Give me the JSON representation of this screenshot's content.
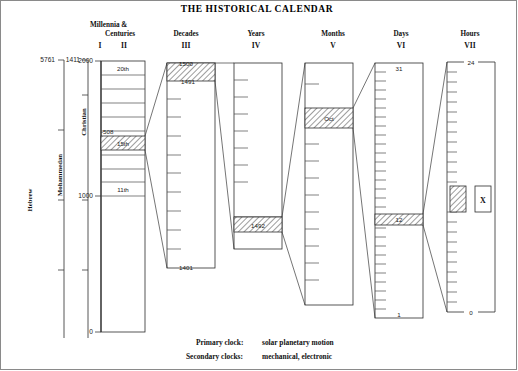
{
  "title": "THE HISTORICAL CALENDAR",
  "captions": {
    "primary_label": "Primary clock:",
    "primary_value": "solar planetary motion",
    "secondary_label": "Secondary clocks:",
    "secondary_value": "mechanical, electronic"
  },
  "era_axes": [
    {
      "name": "Hebrew",
      "top_value": "5761"
    },
    {
      "name": "Mohammedan",
      "top_value": "1411"
    }
  ],
  "columns": [
    {
      "id": "I",
      "roman": "I",
      "header": "Millennia &",
      "header2": "Centuries",
      "scale_name": "Christian",
      "top_label": "2000",
      "mid_label": "1000",
      "bottom_label": "0"
    },
    {
      "id": "II",
      "roman": "II",
      "header": "",
      "top_label": "20th",
      "highlight_label": "15th",
      "edge_label": "-508",
      "low_label": "11th"
    },
    {
      "id": "III",
      "roman": "III",
      "header": "Decades",
      "top_label": "1500",
      "second_label": "1491",
      "bottom_label": "1401"
    },
    {
      "id": "IV",
      "roman": "IV",
      "header": "Years",
      "highlight_label": "1492"
    },
    {
      "id": "V",
      "roman": "V",
      "header": "Months",
      "highlight_label": "Oct"
    },
    {
      "id": "VI",
      "roman": "VI",
      "header": "Days",
      "top_label": "31",
      "highlight_label": "12",
      "bottom_label": "1"
    },
    {
      "id": "VII",
      "roman": "VII",
      "header": "Hours",
      "top_label": "24",
      "bottom_label": "0",
      "marker_label": "X"
    }
  ]
}
